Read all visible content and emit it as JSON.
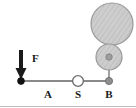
{
  "figure": {
    "type": "mechanics-free-body-diagram",
    "width": 136,
    "height": 108,
    "background_color": "#ffffff",
    "border": {
      "bottom_rule_color": "#bdbdbd",
      "bottom_rule_visible": true
    },
    "labels": {
      "force": "F",
      "segment_a": "A",
      "pivot_s": "S",
      "point_b": "B"
    },
    "colors": {
      "rod": "#8a8a8a",
      "arrow": "#1a1a1a",
      "node_fill_dark": "#111111",
      "node_fill_open": "#ffffff",
      "node_stroke": "#555555",
      "disk_fill": "#c9c9c9",
      "disk_stroke": "#9a9a9a",
      "hatch": "#b0b0b0",
      "text": "#1a1a1a"
    },
    "geometry": {
      "rod": {
        "x1": 21,
        "y1": 81,
        "x2": 109,
        "y2": 81,
        "stroke_width": 2
      },
      "force_arrow": {
        "x": 21,
        "y_start": 50,
        "y_end": 79,
        "shaft_width": 4,
        "head_width": 11,
        "head_height": 11
      },
      "node_left": {
        "cx": 21,
        "cy": 81,
        "r": 3.4,
        "style": "filled-dark"
      },
      "node_s": {
        "cx": 78,
        "cy": 81,
        "r": 5.4,
        "style": "open"
      },
      "node_b": {
        "cx": 109,
        "cy": 81,
        "r": 3.6,
        "style": "filled-gray"
      },
      "link_vertical": {
        "x": 109,
        "y1": 81,
        "y2": 57,
        "stroke_width": 1.6
      },
      "disk_small": {
        "cx": 109,
        "cy": 57,
        "r": 13
      },
      "disk_small_hub": {
        "cx": 109,
        "cy": 57,
        "r": 3.2
      },
      "disk_large": {
        "cx": 112,
        "cy": 24,
        "r": 21
      },
      "label_force": {
        "x": 32,
        "y": 62
      },
      "label_a": {
        "x": 48,
        "y": 98
      },
      "label_s": {
        "x": 75,
        "y": 98
      },
      "label_b": {
        "x": 106,
        "y": 98
      }
    },
    "elements": [
      {
        "name": "force-arrow",
        "label": "F"
      },
      {
        "name": "rod-segment-a",
        "label": "A"
      },
      {
        "name": "pivot-joint",
        "label": "S"
      },
      {
        "name": "rod-end-b",
        "label": "B"
      },
      {
        "name": "small-hatched-disk",
        "label": ""
      },
      {
        "name": "large-hatched-disk",
        "label": ""
      }
    ]
  }
}
